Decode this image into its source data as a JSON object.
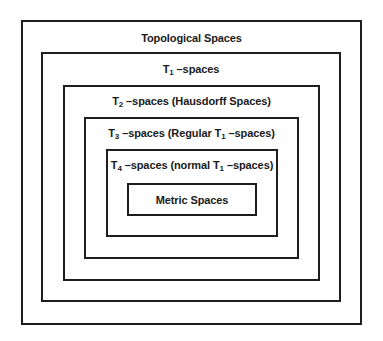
{
  "diagram": {
    "type": "nested-sets",
    "levels": [
      {
        "id": "topological",
        "label": "Topological Spaces"
      },
      {
        "id": "t1",
        "prefix": "T",
        "sub": "1",
        "label": " –spaces"
      },
      {
        "id": "t2",
        "prefix": "T",
        "sub": "2",
        "label": " –spaces (Hausdorff Spaces)"
      },
      {
        "id": "t3",
        "prefix": "T",
        "sub": "3",
        "label_a": " –spaces (Regular T",
        "sub_b": "1",
        "label_b": " –spaces)"
      },
      {
        "id": "t4",
        "prefix": "T",
        "sub": "4",
        "label_a": " –spaces (normal T",
        "sub_b": "1",
        "label_b": " –spaces)"
      },
      {
        "id": "metric",
        "label": "Metric Spaces"
      }
    ]
  }
}
